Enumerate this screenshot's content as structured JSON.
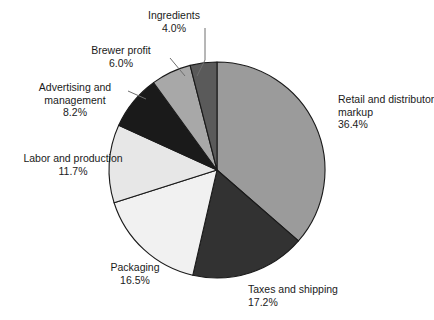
{
  "chart_data": {
    "type": "pie",
    "title": "",
    "subtitle": "",
    "xlabel": "",
    "ylabel": "",
    "legend_position": "none",
    "grid": false,
    "labels_outside": true,
    "start_angle_deg": 0,
    "direction": "clockwise",
    "categories": [
      "Retail and distributor markup",
      "Taxes and shipping",
      "Packaging",
      "Labor and production",
      "Advertising and management",
      "Brewer profit",
      "Ingredients"
    ],
    "values": [
      36.4,
      17.2,
      16.5,
      11.7,
      8.2,
      6.0,
      4.0
    ],
    "value_labels": [
      "36.4%",
      "17.2%",
      "16.5%",
      "11.7%",
      "8.2%",
      "6.0%",
      "4.0%"
    ],
    "total": 100.0,
    "units": "percent",
    "slices": [
      {
        "name": "retail-and-distributor-markup",
        "label_lines": [
          "Retail and distributor",
          "markup"
        ],
        "value_label": "36.4%",
        "value": 36.4,
        "color": "#9b9b9b"
      },
      {
        "name": "taxes-and-shipping",
        "label_lines": [
          "Taxes and shipping"
        ],
        "value_label": "17.2%",
        "value": 17.2,
        "color": "#323232"
      },
      {
        "name": "packaging",
        "label_lines": [
          "Packaging"
        ],
        "value_label": "16.5%",
        "value": 16.5,
        "color": "#f1f1f1"
      },
      {
        "name": "labor-and-production",
        "label_lines": [
          "Labor and production"
        ],
        "value_label": "11.7%",
        "value": 11.7,
        "color": "#e7e7e7"
      },
      {
        "name": "advertising-and-management",
        "label_lines": [
          "Advertising and",
          "management"
        ],
        "value_label": "8.2%",
        "value": 8.2,
        "color": "#1a1a1a"
      },
      {
        "name": "brewer-profit",
        "label_lines": [
          "Brewer profit"
        ],
        "value_label": "6.0%",
        "value": 6.0,
        "color": "#a8a8a8"
      },
      {
        "name": "ingredients",
        "label_lines": [
          "Ingredients"
        ],
        "value_label": "4.0%",
        "value": 4.0,
        "color": "#5a5a5a"
      }
    ],
    "style": {
      "edge_color": "#1a1a1a",
      "background": "#ffffff",
      "leader_line_color": "#6e6e6e"
    }
  },
  "labels": {
    "retail_l1": "Retail and distributor",
    "retail_l2": "markup",
    "retail_val": "36.4%",
    "taxes_l1": "Taxes and shipping",
    "taxes_val": "17.2%",
    "packaging_l1": "Packaging",
    "packaging_val": "16.5%",
    "labor_l1": "Labor and production",
    "labor_val": "11.7%",
    "advert_l1": "Advertising and",
    "advert_l2": "management",
    "advert_val": "8.2%",
    "brewer_l1": "Brewer profit",
    "brewer_val": "6.0%",
    "ingredients_l1": "Ingredients",
    "ingredients_val": "4.0%"
  }
}
